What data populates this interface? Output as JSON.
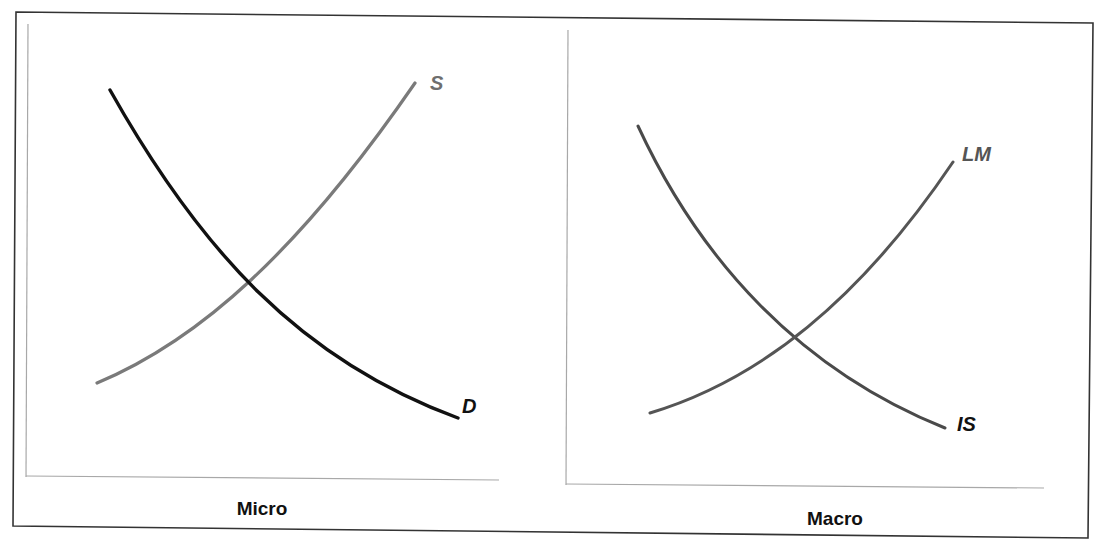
{
  "figure": {
    "panels": [
      {
        "id": "micro",
        "caption": "Micro",
        "curves": [
          {
            "name": "S",
            "label": "S",
            "slope": "upward",
            "color": "#7a7a7a"
          },
          {
            "name": "D",
            "label": "D",
            "slope": "downward",
            "color": "#111111"
          }
        ]
      },
      {
        "id": "macro",
        "caption": "Macro",
        "curves": [
          {
            "name": "LM",
            "label": "LM",
            "slope": "upward",
            "color": "#555555"
          },
          {
            "name": "IS",
            "label": "IS",
            "slope": "downward",
            "color": "#4a4a4a"
          }
        ]
      }
    ]
  },
  "colors": {
    "frame": "#333333",
    "axis": "#a8a8a8",
    "supply": "#7a7a7a",
    "demand": "#111111",
    "lm": "#555555",
    "is": "#4a4a4a",
    "label_gray": "#6e6e6e",
    "label_dark": "#111111"
  }
}
